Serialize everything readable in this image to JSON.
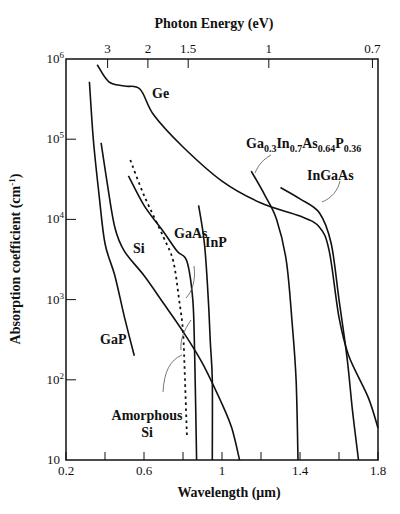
{
  "chart_data": {
    "type": "line",
    "title": "",
    "top_axis_title": "Photon Energy (eV)",
    "xlabel": "Wavelength (μm)",
    "ylabel": "Absorption coefficient (cm⁻¹)",
    "xscale": "linear",
    "yscale": "log",
    "xlim": [
      0.2,
      1.8
    ],
    "ylim": [
      10,
      1000000
    ],
    "x_ticks": [
      0.2,
      0.4,
      0.6,
      0.8,
      1.0,
      1.2,
      1.4,
      1.6,
      1.8
    ],
    "x_tick_labels": [
      {
        "value": 0.2,
        "label": "0.2"
      },
      {
        "value": 0.6,
        "label": "0.6"
      },
      {
        "value": 1.0,
        "label": "1"
      },
      {
        "value": 1.4,
        "label": "1.4"
      },
      {
        "value": 1.8,
        "label": "1.8"
      }
    ],
    "y_tick_labels": [
      {
        "value": 10,
        "label": "10"
      },
      {
        "value": 100,
        "label": "10",
        "exp": "2"
      },
      {
        "value": 1000,
        "label": "10",
        "exp": "3"
      },
      {
        "value": 10000,
        "label": "10",
        "exp": "4"
      },
      {
        "value": 100000,
        "label": "10",
        "exp": "5"
      },
      {
        "value": 1000000,
        "label": "10",
        "exp": "6"
      }
    ],
    "top_ticks": [
      {
        "energy_eV": 3,
        "label": "3"
      },
      {
        "energy_eV": 2,
        "label": "2"
      },
      {
        "energy_eV": 1.5,
        "label": "1.5"
      },
      {
        "energy_eV": 1,
        "label": "1"
      },
      {
        "energy_eV": 0.7,
        "label": "0.7"
      }
    ],
    "grid": false,
    "legend": "none (curves labeled directly)",
    "series": [
      {
        "name": "Ge",
        "style": "solid",
        "points": [
          [
            0.36,
            850000
          ],
          [
            0.42,
            520000
          ],
          [
            0.5,
            460000
          ],
          [
            0.58,
            420000
          ],
          [
            0.65,
            200000
          ],
          [
            0.8,
            80000
          ],
          [
            1.0,
            30000
          ],
          [
            1.2,
            16000
          ],
          [
            1.4,
            11000
          ],
          [
            1.5,
            8000
          ],
          [
            1.55,
            4000
          ],
          [
            1.6,
            600
          ],
          [
            1.65,
            200
          ],
          [
            1.75,
            60
          ],
          [
            1.8,
            25
          ]
        ]
      },
      {
        "name": "Si",
        "style": "solid",
        "points": [
          [
            0.38,
            90000
          ],
          [
            0.41,
            30000
          ],
          [
            0.45,
            8000
          ],
          [
            0.5,
            4000
          ],
          [
            0.6,
            2000
          ],
          [
            0.7,
            900
          ],
          [
            0.8,
            400
          ],
          [
            0.9,
            160
          ],
          [
            1.0,
            50
          ],
          [
            1.05,
            25
          ],
          [
            1.09,
            10
          ]
        ]
      },
      {
        "name": "GaAs",
        "style": "solid",
        "points": [
          [
            0.52,
            35000
          ],
          [
            0.6,
            15000
          ],
          [
            0.7,
            7000
          ],
          [
            0.77,
            4000
          ],
          [
            0.82,
            3000
          ],
          [
            0.85,
            1000
          ],
          [
            0.86,
            200
          ],
          [
            0.87,
            10
          ]
        ]
      },
      {
        "name": "InP",
        "style": "solid",
        "points": [
          [
            0.88,
            15000
          ],
          [
            0.91,
            5000
          ],
          [
            0.93,
            1000
          ],
          [
            0.94,
            300
          ],
          [
            0.95,
            100
          ],
          [
            0.95,
            10
          ]
        ]
      },
      {
        "name": "GaP",
        "style": "solid",
        "points": [
          [
            0.32,
            520000
          ],
          [
            0.34,
            100000
          ],
          [
            0.37,
            20000
          ],
          [
            0.4,
            5000
          ],
          [
            0.45,
            2000
          ],
          [
            0.5,
            600
          ],
          [
            0.55,
            200
          ]
        ]
      },
      {
        "name": "Amorphous Si",
        "style": "dashed",
        "points": [
          [
            0.53,
            55000
          ],
          [
            0.6,
            20000
          ],
          [
            0.7,
            6000
          ],
          [
            0.75,
            3000
          ],
          [
            0.78,
            1000
          ],
          [
            0.8,
            400
          ],
          [
            0.81,
            100
          ],
          [
            0.82,
            20
          ]
        ]
      },
      {
        "name": "Ga0.3In0.7As0.64P0.36",
        "style": "solid",
        "points": [
          [
            1.15,
            40000
          ],
          [
            1.22,
            20000
          ],
          [
            1.28,
            10000
          ],
          [
            1.33,
            3000
          ],
          [
            1.36,
            500
          ],
          [
            1.38,
            100
          ],
          [
            1.39,
            10
          ]
        ]
      },
      {
        "name": "InGaAs",
        "style": "solid",
        "points": [
          [
            1.3,
            25000
          ],
          [
            1.4,
            18000
          ],
          [
            1.5,
            12000
          ],
          [
            1.56,
            5000
          ],
          [
            1.6,
            1000
          ],
          [
            1.64,
            200
          ],
          [
            1.67,
            40
          ],
          [
            1.7,
            10
          ]
        ]
      }
    ],
    "annotations": [
      {
        "text": "Ge"
      },
      {
        "text": "Si"
      },
      {
        "text": "GaAs"
      },
      {
        "text": "InP"
      },
      {
        "text": "GaP"
      },
      {
        "text": "Amorphous Si"
      },
      {
        "text": "Ga0.3In0.7As0.64P0.36"
      },
      {
        "text": "InGaAs"
      }
    ]
  },
  "labels": {
    "top_axis_title": "Photon Energy (eV)",
    "xlabel": "Wavelength (μm)",
    "ylabel": "Absorption coefficient (cm",
    "ylabel_sup": "-1",
    "ylabel_end": ")",
    "ge": "Ge",
    "si": "Si",
    "gaas": "GaAs",
    "inp": "InP",
    "gap": "GaP",
    "amorphous_1": "Amorphous",
    "amorphous_2": "Si",
    "ingaas": "InGaAs",
    "quat": {
      "ga": "Ga",
      "ga_sub": "0.3",
      "in": "In",
      "in_sub": "0.7",
      "as": "As",
      "as_sub": "0.64",
      "p": "P",
      "p_sub": "0.36"
    }
  }
}
